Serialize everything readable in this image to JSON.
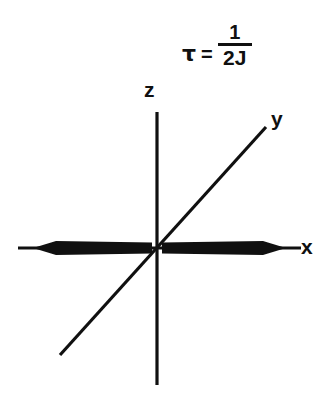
{
  "figure": {
    "background_color": "#ffffff",
    "ink_color": "#101010",
    "formula": {
      "symbol": "τ",
      "relation": "=",
      "numerator": "1",
      "denominator": "2J"
    },
    "axes": {
      "origin": {
        "x": 157,
        "y": 248
      },
      "z_axis": {
        "label": "z",
        "x1": 157,
        "y1": 112,
        "x2": 157,
        "y2": 385
      },
      "y_axis": {
        "label": "y",
        "x1": 60,
        "y1": 355,
        "x2": 266,
        "y2": 127
      },
      "x_axis": {
        "label": "x",
        "x1": 18,
        "y1": 248,
        "x2": 301,
        "y2": 248
      }
    },
    "arrows": {
      "left": {
        "tip_x": 33,
        "tail_x": 152,
        "y": 248,
        "half_width": 7
      },
      "right": {
        "tip_x": 286,
        "tail_x": 162,
        "y": 248,
        "half_width": 7
      }
    }
  }
}
